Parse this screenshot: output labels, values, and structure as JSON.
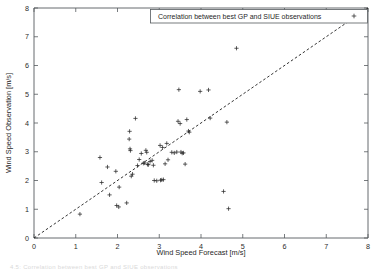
{
  "figure": {
    "background": "#ffffff",
    "foreground": "#1f1f1f",
    "caption_fragment": "4.5: Correlation between best GP and SIUE observations"
  },
  "chart_data": {
    "type": "scatter",
    "title": "",
    "xlabel": "Wind Speed Forecast [m/s]",
    "ylabel": "Wind Speed Observation [m/s]",
    "xlim": [
      0,
      8
    ],
    "ylim": [
      0,
      8
    ],
    "xticks": [
      0,
      1,
      2,
      3,
      4,
      5,
      6,
      7,
      8
    ],
    "yticks": [
      0,
      1,
      2,
      3,
      4,
      5,
      6,
      7,
      8
    ],
    "xtick_labels": [
      "0",
      "1",
      "2",
      "3",
      "4",
      "5",
      "6",
      "7",
      "8"
    ],
    "ytick_labels": [
      "0",
      "1",
      "2",
      "3",
      "4",
      "5",
      "6",
      "7",
      "8"
    ],
    "grid": false,
    "legend_position": "top-right",
    "legend": [
      {
        "label": "Correlation between best GP and SIUE observations",
        "marker": "+",
        "color": "#2a2a2a"
      }
    ],
    "annotations": [
      {
        "type": "reference-line",
        "label": "one-to-one line",
        "style": "dashed",
        "from": [
          0,
          0
        ],
        "to": [
          8,
          8
        ],
        "color": "#1d1d1d"
      }
    ],
    "series": [
      {
        "name": "Correlation between best GP and SIUE observations",
        "marker": "+",
        "color": "#2a2a2a",
        "points": [
          [
            1.1,
            0.83
          ],
          [
            1.58,
            2.8
          ],
          [
            1.62,
            1.93
          ],
          [
            1.76,
            2.47
          ],
          [
            1.81,
            1.5
          ],
          [
            1.96,
            2.32
          ],
          [
            1.98,
            1.13
          ],
          [
            2.03,
            1.08
          ],
          [
            2.04,
            1.77
          ],
          [
            2.22,
            1.22
          ],
          [
            2.28,
            3.44
          ],
          [
            2.29,
            3.71
          ],
          [
            2.3,
            3.1
          ],
          [
            2.31,
            3.04
          ],
          [
            2.33,
            2.15
          ],
          [
            2.36,
            2.22
          ],
          [
            2.43,
            4.16
          ],
          [
            2.48,
            2.52
          ],
          [
            2.52,
            2.73
          ],
          [
            2.57,
            2.94
          ],
          [
            2.62,
            2.6
          ],
          [
            2.65,
            2.61
          ],
          [
            2.68,
            3.05
          ],
          [
            2.7,
            2.98
          ],
          [
            2.72,
            2.56
          ],
          [
            2.74,
            2.55
          ],
          [
            2.78,
            2.66
          ],
          [
            2.83,
            2.7
          ],
          [
            2.86,
            2.53
          ],
          [
            2.88,
            2.0
          ],
          [
            2.94,
            1.99
          ],
          [
            3.02,
            3.22
          ],
          [
            3.03,
            2.01
          ],
          [
            3.06,
            2.02
          ],
          [
            3.08,
            3.15
          ],
          [
            3.1,
            2.03
          ],
          [
            3.14,
            2.58
          ],
          [
            3.18,
            3.29
          ],
          [
            3.21,
            2.72
          ],
          [
            3.3,
            2.98
          ],
          [
            3.36,
            2.96
          ],
          [
            3.42,
            2.99
          ],
          [
            3.45,
            4.06
          ],
          [
            3.47,
            5.16
          ],
          [
            3.5,
            3.98
          ],
          [
            3.52,
            2.99
          ],
          [
            3.55,
            2.95
          ],
          [
            3.58,
            2.96
          ],
          [
            3.62,
            2.57
          ],
          [
            3.66,
            4.12
          ],
          [
            3.7,
            3.72
          ],
          [
            3.72,
            3.68
          ],
          [
            3.98,
            5.1
          ],
          [
            4.18,
            5.15
          ],
          [
            4.22,
            4.17
          ],
          [
            4.54,
            1.62
          ],
          [
            4.62,
            4.03
          ],
          [
            4.66,
            1.02
          ],
          [
            4.85,
            6.6
          ],
          [
            7.58,
            7.78
          ]
        ]
      }
    ]
  },
  "axes": {
    "x_axis_name": "x-axis",
    "y_axis_name": "y-axis"
  }
}
